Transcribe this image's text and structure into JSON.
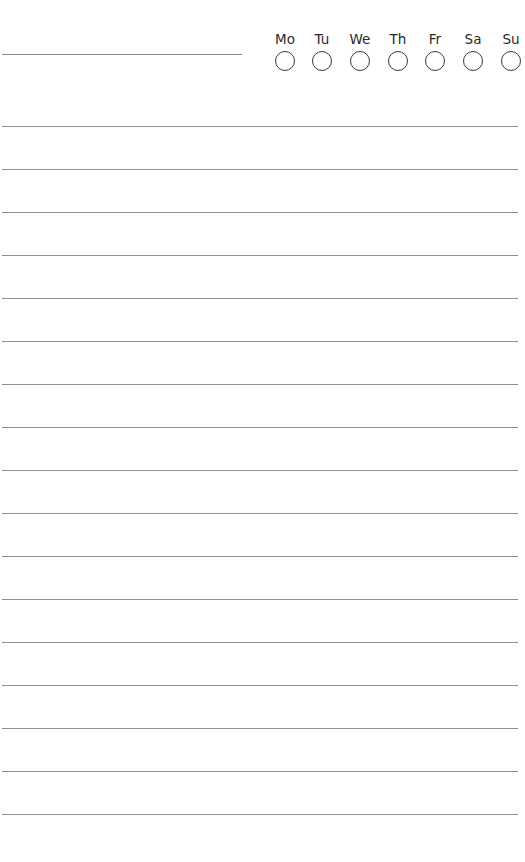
{
  "page": {
    "type": "lined-notes-page",
    "background": "#ffffff",
    "line_color": "#8f8f8f",
    "ink_color": "#2a2a2a"
  },
  "header": {
    "title_field": ""
  },
  "week_tracker": {
    "days": [
      {
        "label": "Mo",
        "checked": false
      },
      {
        "label": "Tu",
        "checked": false
      },
      {
        "label": "We",
        "checked": false
      },
      {
        "label": "Th",
        "checked": false
      },
      {
        "label": "Fr",
        "checked": false
      },
      {
        "label": "Sa",
        "checked": false
      },
      {
        "label": "Su",
        "checked": false
      }
    ]
  },
  "ruled_lines": {
    "count": 17,
    "first_y": 126,
    "spacing": 43
  }
}
